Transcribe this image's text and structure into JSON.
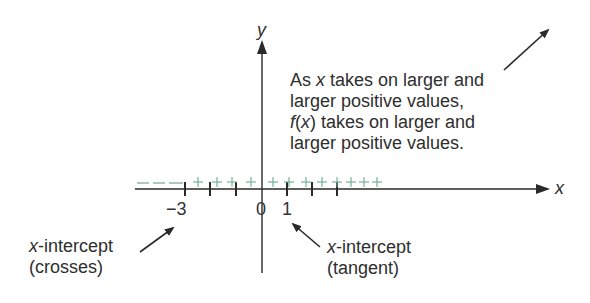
{
  "axes": {
    "x_label": "x",
    "y_label": "y"
  },
  "ticks": {
    "neg3": "−3",
    "zero": "0",
    "one": "1"
  },
  "sign_chart": {
    "negative_region": "– – –",
    "negative_symbol": "–",
    "positive_symbol": "+",
    "positive_count": 12,
    "color": "#6fa98c"
  },
  "annotations": {
    "end_behavior": {
      "line1_prefix": "As ",
      "line1_var": "x",
      "line1_suffix": " takes on larger and",
      "line2": "larger positive values,",
      "line3_func": "f",
      "line3_open": "(",
      "line3_var": "x",
      "line3_close": ")",
      "line3_suffix": " takes on larger and",
      "line4": "larger positive values."
    },
    "crosses": {
      "var": "x",
      "line1_suffix": "-intercept",
      "line2": "(crosses)"
    },
    "tangent": {
      "var": "x",
      "line1_suffix": "-intercept",
      "line2": "(tangent)"
    }
  },
  "colors": {
    "axis": "#2a2a2a",
    "sign_chart": "#6fa98c",
    "text": "#2e2e2e"
  }
}
